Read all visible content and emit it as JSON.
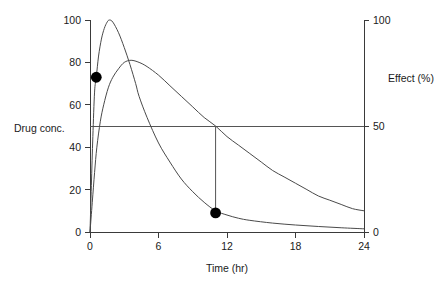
{
  "chart_data": {
    "type": "line",
    "title": "",
    "xlabel": "Time (hr)",
    "ylabel_left": "Drug conc.",
    "ylabel_right": "Effect (%)",
    "xlim": [
      0,
      24
    ],
    "xticks": [
      0,
      6,
      12,
      18,
      24
    ],
    "xticklabels": [
      "0",
      "6",
      "12",
      "18",
      "24"
    ],
    "ylim_left": [
      0,
      100
    ],
    "yticks_left": [
      0,
      20,
      40,
      60,
      80,
      100
    ],
    "yticklabels_left": [
      "0",
      "20",
      "40",
      "60",
      "80",
      "100"
    ],
    "ylim_right": [
      0,
      100
    ],
    "yticks_right": [
      0,
      50,
      100
    ],
    "yticklabels_right": [
      "0",
      "50",
      "100"
    ],
    "grid": false,
    "legend": "none",
    "series": [
      {
        "name": "Drug concentration",
        "axis": "left",
        "peak_x": 1.7,
        "peak_y": 100,
        "end_y": 1.5,
        "points": [
          [
            0.0,
            0
          ],
          [
            0.12,
            22
          ],
          [
            0.25,
            45
          ],
          [
            0.4,
            66
          ],
          [
            0.55,
            73
          ],
          [
            0.75,
            83
          ],
          [
            1.0,
            91
          ],
          [
            1.25,
            96
          ],
          [
            1.5,
            99
          ],
          [
            1.7,
            100
          ],
          [
            2.0,
            99
          ],
          [
            2.5,
            94
          ],
          [
            3.0,
            87
          ],
          [
            3.5,
            79
          ],
          [
            4.0,
            70
          ],
          [
            4.3,
            64
          ],
          [
            5.0,
            54
          ],
          [
            6.0,
            42
          ],
          [
            7.0,
            33
          ],
          [
            8.0,
            25
          ],
          [
            9.0,
            19
          ],
          [
            10.0,
            14
          ],
          [
            11.0,
            10
          ],
          [
            12.0,
            8
          ],
          [
            13.0,
            6.5
          ],
          [
            14.0,
            5.5
          ],
          [
            16.0,
            4.2
          ],
          [
            18.0,
            3.3
          ],
          [
            20.0,
            2.6
          ],
          [
            22.0,
            2.0
          ],
          [
            24.0,
            1.5
          ]
        ]
      },
      {
        "name": "Effect",
        "axis": "right",
        "peak_x": 3.6,
        "peak_y": 81,
        "end_y": 10,
        "points": [
          [
            0.0,
            0
          ],
          [
            0.2,
            14
          ],
          [
            0.4,
            28
          ],
          [
            0.6,
            40
          ],
          [
            0.9,
            52
          ],
          [
            1.2,
            60
          ],
          [
            1.6,
            68
          ],
          [
            2.0,
            73
          ],
          [
            2.5,
            77
          ],
          [
            3.0,
            80
          ],
          [
            3.6,
            81
          ],
          [
            4.3,
            80
          ],
          [
            5.0,
            78
          ],
          [
            6.0,
            74
          ],
          [
            7.0,
            69
          ],
          [
            8.0,
            64
          ],
          [
            9.0,
            59
          ],
          [
            10.0,
            54
          ],
          [
            11.0,
            50
          ],
          [
            12.0,
            45
          ],
          [
            13.0,
            41
          ],
          [
            14.0,
            37
          ],
          [
            15.0,
            33
          ],
          [
            16.0,
            29
          ],
          [
            17.0,
            26
          ],
          [
            18.0,
            23
          ],
          [
            19.0,
            20
          ],
          [
            20.0,
            17
          ],
          [
            21.0,
            15
          ],
          [
            22.0,
            13
          ],
          [
            23.0,
            11
          ],
          [
            24.0,
            10
          ]
        ]
      }
    ],
    "reference_lines": [
      {
        "name": "threshold-50",
        "orientation": "horizontal",
        "value": 50,
        "x_from": 0,
        "x_to": 24
      },
      {
        "name": "drop-line-at-11hr",
        "orientation": "vertical",
        "value": 11,
        "y_from": 9,
        "y_to": 50
      }
    ],
    "markers": [
      {
        "name": "marker-early",
        "x": 0.55,
        "y": 73
      },
      {
        "name": "marker-late",
        "x": 11,
        "y": 9
      }
    ]
  }
}
